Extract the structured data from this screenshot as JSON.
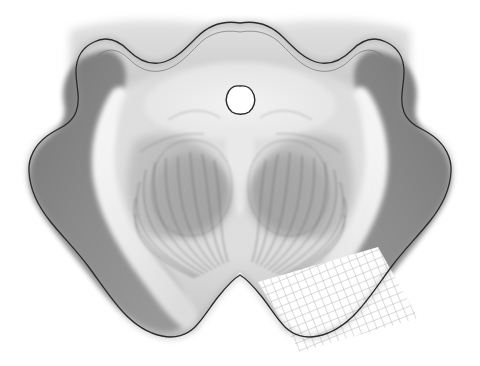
{
  "figure": {
    "kind": "grayscale-anatomical-illustration",
    "canvas": {
      "width": 480,
      "height": 366,
      "background": "#ffffff"
    }
  },
  "palette": {
    "background": "#ffffff",
    "outline": "#2b2b2b",
    "tegmentum_light": "#d8d8d8",
    "periaqueductal_gray": "#e3e3e3",
    "pale_band": "#efefef",
    "mid_gray": "#b4b4b4",
    "crus_dark": "#878787",
    "nucleus_dark": "#9a9a9a",
    "fiber_line": "#5a5a5a",
    "grid_line": "#b0b0b0",
    "aqueduct_fill": "#ffffff"
  },
  "regions": [
    {
      "name": "outer-silhouette",
      "label": "Midbrain outline",
      "shade": "#d8d8d8"
    },
    {
      "name": "tectum-superior-colliculi",
      "label": "Superior colliculi (tectum)",
      "shade": "#cfcfcf"
    },
    {
      "name": "periaqueductal-gray",
      "label": "Periaqueductal gray",
      "shade": "#e6e6e6"
    },
    {
      "name": "cerebral-aqueduct",
      "label": "Cerebral aqueduct",
      "shade": "#ffffff"
    },
    {
      "name": "red-nucleus-left",
      "label": "Red nucleus (left)",
      "shade": "#9d9d9d"
    },
    {
      "name": "red-nucleus-right",
      "label": "Red nucleus (right)",
      "shade": "#9d9d9d"
    },
    {
      "name": "substantia-nigra-left",
      "label": "Substantia nigra (left)",
      "shade": "#f0f0f0"
    },
    {
      "name": "substantia-nigra-right",
      "label": "Substantia nigra (right)",
      "shade": "#f0f0f0"
    },
    {
      "name": "crus-cerebri-left",
      "label": "Crus cerebri (left)",
      "shade": "#8a8a8a"
    },
    {
      "name": "crus-cerebri-right",
      "label": "Crus cerebri (right)",
      "shade": "#8a8a8a"
    },
    {
      "name": "interpeduncular-fossa",
      "label": "Interpeduncular fossa",
      "shade": "#ffffff"
    },
    {
      "name": "hatched-overlay-patch",
      "label": "Cross-hatched marked region",
      "shade": "#ffffff"
    }
  ],
  "overlay": {
    "name": "grid-hatch",
    "label": "Cross-hatch grid patch",
    "spacing_px": 8,
    "rotation_deg": -22,
    "stroke": "#b0b0b0",
    "stroke_width": 0.9
  },
  "geometry": {
    "silhouette_path": "M240,23 C258,20 272,26 283,37 C294,48 303,58 316,62 C330,66 342,60 352,50 C362,40 374,36 386,42 C399,48 404,60 404,72 C404,86 399,99 404,112 C409,125 422,128 433,136 C445,145 452,158 451,172 C450,190 442,206 430,221 C418,236 404,250 392,266 C380,282 370,298 357,312 C346,324 333,333 318,336 C305,339 293,335 285,327 C276,318 270,307 262,297 C254,287 247,279 240,275 C233,279 226,287 218,297 C210,307 204,318 195,327 C187,335 175,339 162,336 C147,333 134,324 123,312 C110,298 100,282 88,266 C76,250 62,236 50,221 C38,206 30,190 29,172 C28,158 35,145 47,136 C58,128 71,125 76,112 C81,99 76,86 76,72 C76,60 81,48 94,42 C106,36 118,40 128,50 C138,60 150,66 164,62 C177,58 186,48 197,37 C208,26 222,20 240,23 Z",
    "aqueduct_path": "M240,86 C247,85 252,89 254,95 C256,101 254,108 249,112 C245,115 236,115 232,112 C227,108 225,101 227,95 C229,89 233,85 240,86 Z"
  }
}
